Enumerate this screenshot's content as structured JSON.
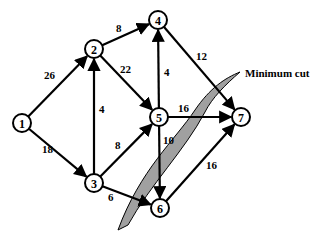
{
  "diagram": {
    "type": "flow-network",
    "nodes": [
      {
        "id": "1",
        "label": "1",
        "x": 22,
        "y": 123
      },
      {
        "id": "2",
        "label": "2",
        "x": 94,
        "y": 49
      },
      {
        "id": "3",
        "label": "3",
        "x": 94,
        "y": 183
      },
      {
        "id": "4",
        "label": "4",
        "x": 158,
        "y": 20
      },
      {
        "id": "5",
        "label": "5",
        "x": 159,
        "y": 117
      },
      {
        "id": "6",
        "label": "6",
        "x": 160,
        "y": 208
      },
      {
        "id": "7",
        "label": "7",
        "x": 241,
        "y": 117
      }
    ],
    "edges": [
      {
        "from": "1",
        "to": "2",
        "capacity": "26",
        "lx": 44,
        "ly": 79
      },
      {
        "from": "1",
        "to": "3",
        "capacity": "18",
        "lx": 42,
        "ly": 153
      },
      {
        "from": "2",
        "to": "4",
        "capacity": "8",
        "lx": 116,
        "ly": 32
      },
      {
        "from": "2",
        "to": "5",
        "capacity": "22",
        "lx": 120,
        "ly": 73
      },
      {
        "from": "3",
        "to": "2",
        "capacity": "4",
        "lx": 99,
        "ly": 113
      },
      {
        "from": "3",
        "to": "5",
        "capacity": "8",
        "lx": 115,
        "ly": 149
      },
      {
        "from": "3",
        "to": "6",
        "capacity": "6",
        "lx": 108,
        "ly": 201
      },
      {
        "from": "5",
        "to": "4",
        "capacity": "4",
        "lx": 164,
        "ly": 76
      },
      {
        "from": "4",
        "to": "7",
        "capacity": "12",
        "lx": 196,
        "ly": 60
      },
      {
        "from": "5",
        "to": "7",
        "capacity": "16",
        "lx": 178,
        "ly": 112
      },
      {
        "from": "5",
        "to": "6",
        "capacity": "10",
        "lx": 163,
        "ly": 144
      },
      {
        "from": "6",
        "to": "7",
        "capacity": "16",
        "lx": 206,
        "ly": 169
      }
    ],
    "annotation": {
      "label": "Minimum cut",
      "x": 245,
      "y": 77
    }
  }
}
